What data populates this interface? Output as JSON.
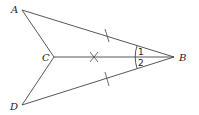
{
  "diagram": {
    "type": "geometry",
    "points": {
      "A": {
        "label": "A",
        "x": 22,
        "y": 10
      },
      "B": {
        "label": "B",
        "x": 174,
        "y": 57
      },
      "C": {
        "label": "C",
        "x": 54,
        "y": 57
      },
      "D": {
        "label": "D",
        "x": 22,
        "y": 105
      }
    },
    "segments": [
      "AB",
      "AC",
      "CB",
      "CD",
      "DB"
    ],
    "congruence_marks": {
      "single_tick": [
        "AB",
        "DB"
      ],
      "x_mark": [
        "CB"
      ]
    },
    "angles": [
      {
        "label": "1",
        "between": [
          "AB",
          "CB"
        ],
        "vertex": "B"
      },
      {
        "label": "2",
        "between": [
          "CB",
          "DB"
        ],
        "vertex": "B"
      }
    ],
    "colors": {
      "stroke": "#444444",
      "text": "#222222",
      "background": "#ffffff"
    }
  }
}
